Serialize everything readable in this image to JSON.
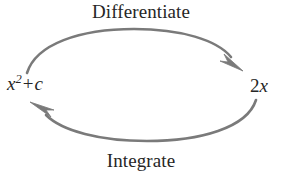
{
  "figure": {
    "title_top": "Differentiate",
    "title_bottom": "Integrate",
    "background_color": "#ffffff",
    "arc_color": "#7a7a7a",
    "text_color": "#262626"
  },
  "nodes": {
    "left": {
      "base": "x",
      "exponent": "2",
      "operator": "+",
      "constant": "c"
    },
    "right": {
      "coefficient": "2",
      "variable": "x"
    }
  },
  "arrows": {
    "top": {
      "label": "Differentiate",
      "direction": "left-to-right",
      "from": "x^2 + c",
      "to": "2x"
    },
    "bottom": {
      "label": "Integrate",
      "direction": "right-to-left",
      "from": "2x",
      "to": "x^2 + c"
    }
  }
}
